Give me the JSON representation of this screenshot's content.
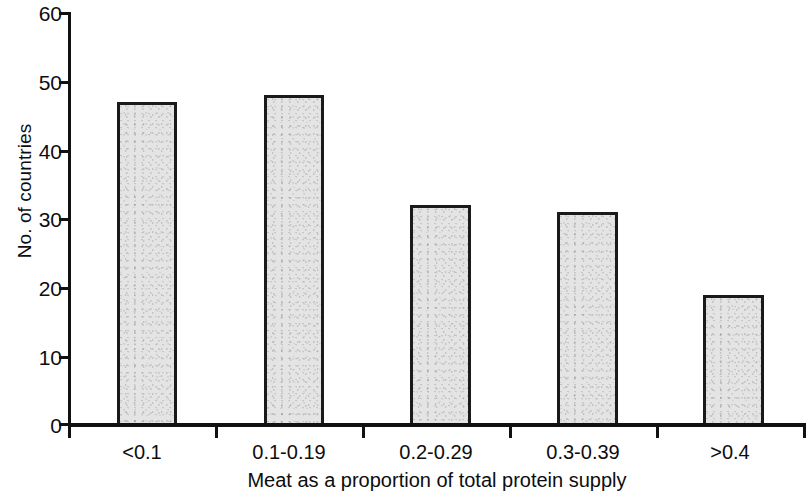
{
  "chart_data": {
    "type": "bar",
    "title": "",
    "subtitle": "",
    "categories": [
      "<0.1",
      "0.1-0.19",
      "0.2-0.29",
      "0.3-0.39",
      ">0.4"
    ],
    "values": [
      47,
      48,
      32,
      31,
      19
    ],
    "xlabel": "Meat as a proportion of total protein supply",
    "ylabel": "No. of countries",
    "ylim": [
      0,
      60
    ],
    "ytick_labels": [
      "0",
      "10",
      "20",
      "30",
      "40",
      "50",
      "60"
    ],
    "ytick_values": [
      0,
      10,
      20,
      30,
      40,
      50,
      60
    ],
    "grid": false,
    "legend": null,
    "legend_position": "none",
    "annotations": [],
    "bar_fill_color": "#e4e4e4",
    "bar_border_color": "#1a1a1a",
    "axis_color": "#111111",
    "background_color": "#ffffff"
  }
}
